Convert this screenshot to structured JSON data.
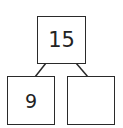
{
  "number_bond": {
    "whole": "15",
    "parts": [
      "9",
      ""
    ]
  },
  "colors": {
    "stroke": "#2a2a2a",
    "background": "#ffffff"
  }
}
